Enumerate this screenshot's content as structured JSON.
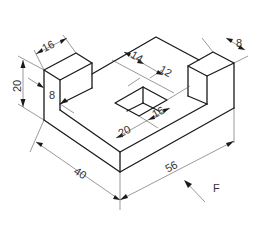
{
  "figure": {
    "type": "isometric-technical-drawing",
    "line_color": "#1a1a1a",
    "dim_color": "#555555"
  },
  "dimensions": {
    "left_post_width": "16",
    "post_height": "20",
    "base_thickness": "8",
    "hole_offset_back": "14",
    "hole_length": "12",
    "hole_width": "16",
    "hole_offset_front": "20",
    "right_post_depth": "8",
    "base_depth": "40",
    "base_length": "56"
  },
  "view_direction": {
    "label": "F"
  }
}
